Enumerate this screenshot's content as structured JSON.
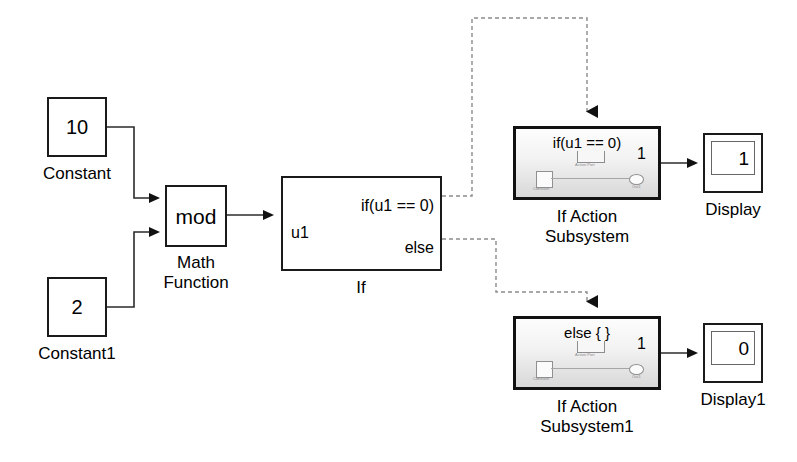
{
  "diagram": {
    "background_color": "#ffffff",
    "line_color": "#1a1a1a",
    "control_line_color": "#8a8a8a",
    "subsystem_fill": "#e8e8e8"
  },
  "blocks": {
    "constant": {
      "value": "10",
      "label": "Constant"
    },
    "constant1": {
      "value": "2",
      "label": "Constant1"
    },
    "math_function": {
      "operator": "mod",
      "label": "Math\nFunction"
    },
    "if_block": {
      "input_port": "u1",
      "output_port_1": "if(u1 == 0)",
      "output_port_2": "else",
      "label": "If"
    },
    "if_action_subsystem": {
      "title": "if(u1 == 0)",
      "label": "If Action\nSubsystem",
      "output_port_number": "1",
      "mini_action_label": "Action Port",
      "mini_const_label": "Constant",
      "mini_out_label": "Out1"
    },
    "if_action_subsystem1": {
      "title": "else { }",
      "label": "If Action\nSubsystem1",
      "output_port_number": "1",
      "mini_action_label": "Action Port",
      "mini_const_label": "Constant",
      "mini_out_label": "Out1"
    },
    "display": {
      "value": "1",
      "label": "Display"
    },
    "display1": {
      "value": "0",
      "label": "Display1"
    }
  }
}
